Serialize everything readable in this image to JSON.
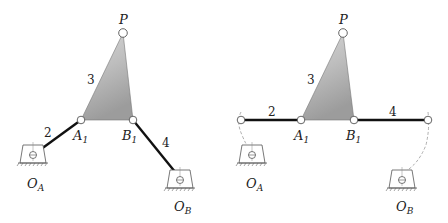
{
  "diagrams": [
    {
      "name": "configuration-1",
      "labels": {
        "P": "P",
        "A1": "A",
        "A1_sub": "1",
        "B1": "B",
        "B1_sub": "1",
        "OA": "O",
        "OA_sub": "A",
        "OB": "O",
        "OB_sub": "B",
        "link2": "2",
        "link3": "3",
        "link4": "4"
      }
    },
    {
      "name": "configuration-2-toggle",
      "labels": {
        "P": "P",
        "A1": "A",
        "A1_sub": "1",
        "B1": "B",
        "B1_sub": "1",
        "OA": "O",
        "OA_sub": "A",
        "OB": "O",
        "OB_sub": "B",
        "link2": "2",
        "link3": "3",
        "link4": "4"
      }
    }
  ],
  "colors": {
    "link": "#111111",
    "coupler_fill_top": "#d9d9d9",
    "coupler_fill_bottom": "#9a9a9a",
    "dashed_arc": "#9a9a9a",
    "ground": "#555555"
  }
}
